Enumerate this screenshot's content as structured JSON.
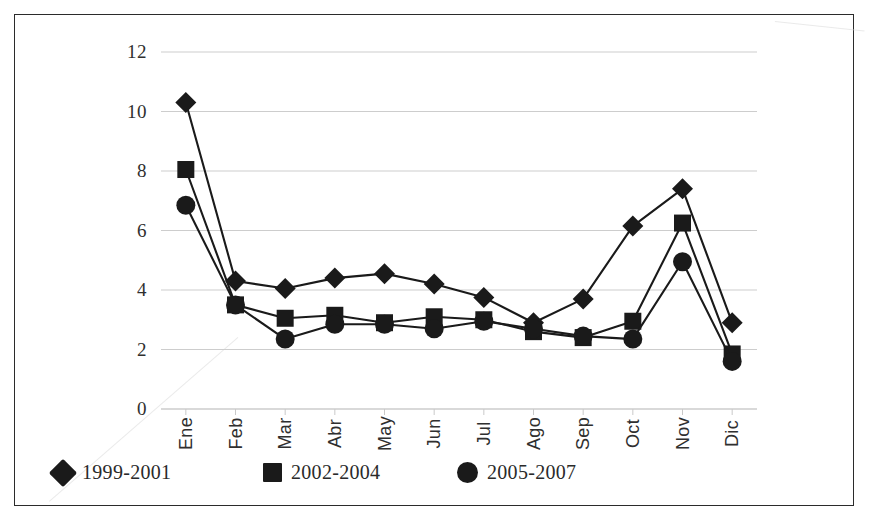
{
  "chart_data": {
    "type": "line",
    "title": "",
    "xlabel": "",
    "ylabel": "",
    "categories": [
      "Ene",
      "Feb",
      "Mar",
      "Abr",
      "May",
      "Jun",
      "Jul",
      "Ago",
      "Sep",
      "Oct",
      "Nov",
      "Dic"
    ],
    "ylim": [
      0,
      12
    ],
    "yticks": [
      0,
      2,
      4,
      6,
      8,
      10,
      12
    ],
    "grid": true,
    "legend_position": "bottom",
    "series": [
      {
        "name": "1999-2001",
        "marker": "diamond",
        "color": "#1a1a1a",
        "values": [
          10.3,
          4.3,
          4.05,
          4.4,
          4.55,
          4.2,
          3.75,
          2.9,
          3.7,
          6.15,
          7.4,
          2.9
        ]
      },
      {
        "name": "2002-2004",
        "marker": "square",
        "color": "#1a1a1a",
        "values": [
          8.05,
          3.5,
          3.05,
          3.15,
          2.9,
          3.1,
          3.0,
          2.6,
          2.4,
          2.95,
          6.25,
          1.85
        ]
      },
      {
        "name": "2005-2007",
        "marker": "circle",
        "color": "#1a1a1a",
        "values": [
          6.85,
          3.5,
          2.35,
          2.85,
          2.85,
          2.7,
          2.95,
          2.7,
          2.45,
          2.35,
          4.95,
          1.6
        ]
      }
    ]
  },
  "legend": {
    "items": [
      {
        "label": "1999-2001",
        "marker": "diamond"
      },
      {
        "label": "2002-2004",
        "marker": "square"
      },
      {
        "label": "2005-2007",
        "marker": "circle"
      }
    ]
  },
  "axis": {
    "y_tick_labels": [
      "12",
      "10",
      "8",
      "6",
      "4",
      "2",
      "0"
    ],
    "x_tick_labels": [
      "Ene",
      "Feb",
      "Mar",
      "Abr",
      "May",
      "Jun",
      "Jul",
      "Ago",
      "Sep",
      "Oct",
      "Nov",
      "Dic"
    ]
  }
}
